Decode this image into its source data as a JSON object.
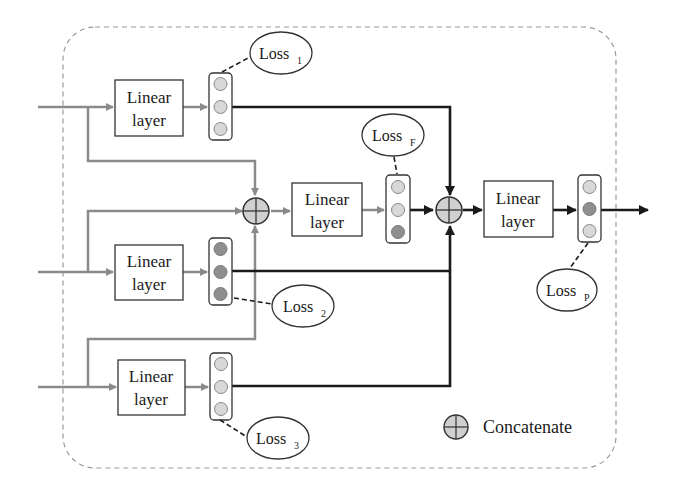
{
  "diagram": {
    "blocks": {
      "linear1": {
        "line1": "Linear",
        "line2": "layer"
      },
      "linear2": {
        "line1": "Linear",
        "line2": "layer"
      },
      "linear3": {
        "line1": "Linear",
        "line2": "layer"
      },
      "linear_fusion": {
        "line1": "Linear",
        "line2": "layer"
      },
      "linear_pred": {
        "line1": "Linear",
        "line2": "layer"
      }
    },
    "losses": {
      "loss1": {
        "base": "Loss",
        "sub": "1"
      },
      "loss2": {
        "base": "Loss",
        "sub": "2"
      },
      "loss3": {
        "base": "Loss",
        "sub": "3"
      },
      "lossF": {
        "base": "Loss",
        "sub": "F"
      },
      "lossP": {
        "base": "Loss",
        "sub": "P"
      }
    },
    "legend": {
      "concat_label": "Concatenate",
      "concat_icon": "circle-plus-icon"
    },
    "colors": {
      "gray_line": "#8a8a8a",
      "dark_line": "#1a1a1a",
      "light_node": "#d8d8d8",
      "dark_node": "#8f8f8f",
      "border_dash": "#9a9a9a"
    }
  }
}
